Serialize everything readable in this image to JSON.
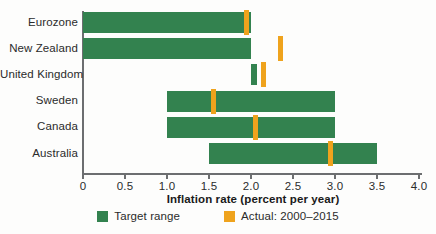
{
  "chart_data": {
    "type": "bar",
    "orientation": "horizontal",
    "title": "",
    "xlabel": "Inflation rate (percent per year)",
    "ylabel": "",
    "xlim": [
      0,
      4.0
    ],
    "xticks": [
      "0",
      "0.5",
      "1.0",
      "1.5",
      "2.0",
      "2.5",
      "3.0",
      "3.5",
      "4.0"
    ],
    "xtick_values": [
      0,
      0.5,
      1.0,
      1.5,
      2.0,
      2.5,
      3.0,
      3.5,
      4.0
    ],
    "grid": false,
    "legend_position": "bottom",
    "categories": [
      "Eurozone",
      "New Zealand",
      "United Kingdom",
      "Sweden",
      "Canada",
      "Australia"
    ],
    "series": [
      {
        "name": "Target range",
        "type": "range",
        "color": "#33824f",
        "values": [
          {
            "category": "Eurozone",
            "low": 0.0,
            "high": 2.0
          },
          {
            "category": "New Zealand",
            "low": 0.0,
            "high": 2.0
          },
          {
            "category": "United Kingdom",
            "low": 2.0,
            "high": 2.07
          },
          {
            "category": "Sweden",
            "low": 1.0,
            "high": 3.0
          },
          {
            "category": "Canada",
            "low": 1.0,
            "high": 3.0
          },
          {
            "category": "Australia",
            "low": 1.5,
            "high": 3.5
          }
        ]
      },
      {
        "name": "Actual: 2000–2015",
        "type": "marker",
        "color": "#efa31d",
        "values": [
          {
            "category": "Eurozone",
            "value": 1.95
          },
          {
            "category": "New Zealand",
            "value": 2.35
          },
          {
            "category": "United Kingdom",
            "value": 2.15
          },
          {
            "category": "Sweden",
            "value": 1.55
          },
          {
            "category": "Canada",
            "value": 2.05
          },
          {
            "category": "Australia",
            "value": 2.95
          }
        ]
      }
    ]
  },
  "axis": {
    "x_title": "Inflation rate (percent per year)"
  },
  "legend": {
    "items": [
      {
        "label": "Target range",
        "color": "#33824f"
      },
      {
        "label": "Actual: 2000–2015",
        "color": "#efa31d"
      }
    ]
  },
  "colors": {
    "target_range": "#33824f",
    "actual": "#efa31d",
    "axis": "#6c6e70",
    "text": "#2b2b2b",
    "background": "#fdfdfc"
  }
}
